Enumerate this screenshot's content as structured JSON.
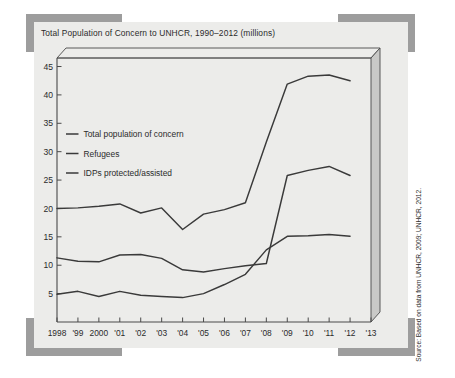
{
  "chart_title": "Total Population of Concern to UNHCR, 1990–2012 (millions)",
  "source_note": "Source: Based on data from UNHCR, 2009; UNHCR, 2012.",
  "colors": {
    "card_background": "#ececea",
    "frame_bracket": "#9d9d9d",
    "line": "#3a3a3a",
    "axis": "#4a4a4a",
    "panel_side": "#c9c9c7"
  },
  "chart_data": {
    "type": "line",
    "title": "Total Population of Concern to UNHCR, 1990–2012 (millions)",
    "xlabel": "",
    "ylabel": "",
    "ylim": [
      0,
      46.5
    ],
    "yticks": [
      5,
      10,
      15,
      20,
      25,
      30,
      35,
      40,
      45
    ],
    "ytick_labels": [
      "5",
      "10",
      "15",
      "20",
      "25",
      "30",
      "35",
      "40",
      "45"
    ],
    "grid": false,
    "legend_position": "upper-left-inside",
    "x": [
      1998,
      1999,
      2000,
      2001,
      2002,
      2003,
      2004,
      2005,
      2006,
      2007,
      2008,
      2009,
      2010,
      2011,
      2012
    ],
    "xticks": [
      1998,
      1999,
      2000,
      2001,
      2002,
      2003,
      2004,
      2005,
      2006,
      2007,
      2008,
      2009,
      2010,
      2011,
      2012,
      2013
    ],
    "xtick_labels": [
      "1998",
      "'99",
      "2000",
      "'01",
      "'02",
      "'03",
      "'04",
      "'05",
      "'06",
      "'07",
      "'08",
      "'09",
      "'10",
      "'11",
      "'12",
      "'13"
    ],
    "series": [
      {
        "name": "Total population of concern",
        "values": [
          20.0,
          20.1,
          20.4,
          20.8,
          19.2,
          20.1,
          16.3,
          19.0,
          19.8,
          21.0,
          31.7,
          41.9,
          43.3,
          43.5,
          42.5
        ]
      },
      {
        "name": "Refugees",
        "values": [
          11.3,
          10.7,
          10.6,
          11.8,
          11.9,
          11.2,
          9.2,
          8.8,
          9.4,
          9.9,
          10.3,
          25.8,
          26.7,
          27.4,
          25.8
        ]
      },
      {
        "name": "IDPs protected/assisted",
        "values": [
          4.9,
          5.4,
          4.5,
          5.4,
          4.7,
          4.5,
          4.3,
          5.0,
          6.6,
          8.4,
          12.7,
          15.1,
          15.2,
          15.4,
          15.1
        ]
      }
    ]
  },
  "legend": {
    "items": [
      {
        "label": "Total population of concern"
      },
      {
        "label": "Refugees"
      },
      {
        "label": "IDPs protected/assisted"
      }
    ]
  }
}
